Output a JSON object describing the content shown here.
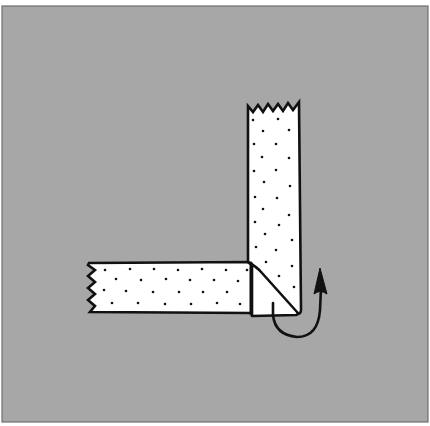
{
  "figure": {
    "colors": {
      "background": "#a7a7a7",
      "frame": "#6e6e6e",
      "strip_fill": "#ffffff",
      "outline": "#111111",
      "dots": "#111111",
      "arrow": "#111111"
    },
    "vertical_strip": {
      "label": "vertical tape strip",
      "top_edge": "zigzag torn end"
    },
    "horizontal_strip": {
      "label": "horizontal tape strip",
      "left_edge": "zigzag torn end"
    },
    "corner_fold": {
      "label": "folded corner flap"
    },
    "arrow": {
      "label": "fold direction arrow",
      "direction": "up"
    }
  }
}
